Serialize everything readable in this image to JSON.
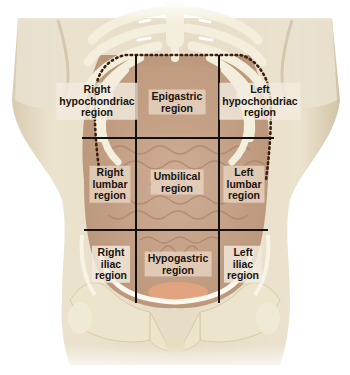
{
  "diagram": {
    "colors": {
      "background": "#ffffff",
      "skin": "#e4d9c3",
      "skin_shadow": "#c9b79a",
      "bone": "#efe9d4",
      "bone_highlight": "#ffffff",
      "organs": "#c9a68c",
      "organs_dark": "#a98268",
      "bladder": "#e7a67f",
      "grid_line": "#111111",
      "dotted_outline": "#3a1f10",
      "label_text": "#1a1410"
    },
    "grid": {
      "vertical_lines_x": [
        136,
        219
      ],
      "vertical_y_range": [
        55,
        303
      ],
      "horizontal_lines": [
        {
          "y": 138,
          "x_start": 82,
          "x_end": 274
        },
        {
          "y": 230,
          "x_start": 84,
          "x_end": 268
        }
      ]
    },
    "regions": [
      {
        "id": "right-hypochondriac",
        "lines": [
          "Right",
          "hypochondriac",
          "region"
        ],
        "cx": 97,
        "cy": 101,
        "row": 1,
        "col": 1
      },
      {
        "id": "epigastric",
        "lines": [
          "Epigastric",
          "region"
        ],
        "cx": 177,
        "cy": 102,
        "row": 1,
        "col": 2
      },
      {
        "id": "left-hypochondriac",
        "lines": [
          "Left",
          "hypochondriac",
          "region"
        ],
        "cx": 260,
        "cy": 101,
        "row": 1,
        "col": 3
      },
      {
        "id": "right-lumbar",
        "lines": [
          "Right",
          "lumbar",
          "region"
        ],
        "cx": 110,
        "cy": 184,
        "row": 2,
        "col": 1
      },
      {
        "id": "umbilical",
        "lines": [
          "Umbilical",
          "region"
        ],
        "cx": 177,
        "cy": 182,
        "row": 2,
        "col": 2
      },
      {
        "id": "left-lumbar",
        "lines": [
          "Left",
          "lumbar",
          "region"
        ],
        "cx": 244,
        "cy": 184,
        "row": 2,
        "col": 3
      },
      {
        "id": "right-iliac",
        "lines": [
          "Right",
          "iliac",
          "region"
        ],
        "cx": 111,
        "cy": 264,
        "row": 3,
        "col": 1
      },
      {
        "id": "hypogastric",
        "lines": [
          "Hypogastric",
          "region"
        ],
        "cx": 178,
        "cy": 264,
        "row": 3,
        "col": 2
      },
      {
        "id": "left-iliac",
        "lines": [
          "Left",
          "iliac",
          "region"
        ],
        "cx": 243,
        "cy": 264,
        "row": 3,
        "col": 3
      }
    ]
  }
}
